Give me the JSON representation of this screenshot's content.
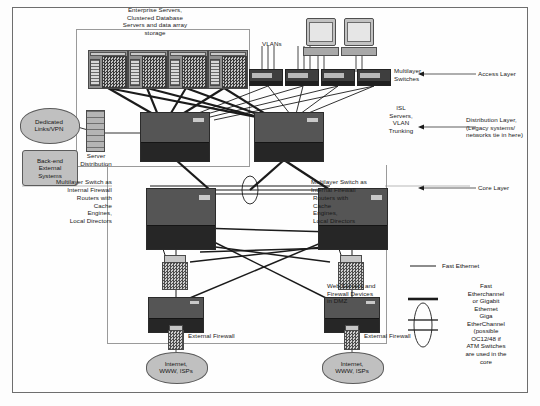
{
  "diagram": {
    "title_group_servers": "Enterprise Servers,\nClustered Database\nServers and data array\nstorage",
    "labels": {
      "vlans": "VLANs",
      "multilayer_switches": "Multilayer\nSwitches",
      "isl_servers": "ISL\nServers,\nVLAN\nTrunking",
      "server_distribution": "Server\nDistribution",
      "internal_firewall_left": "Multilayer Switch as\nInternal Firewall",
      "routers_left": "Routers with\nCache\nEngines,\nLocal Directors",
      "internal_firewall_right": "Multilayer Switch as\nInternal Firewall",
      "routers_right": "Routers with\nCache\nEngines,\nLocal Directors",
      "web_servers_dmz": "Web Servers and\nFirewall Devices\nin DMZ",
      "external_firewall_left": "External Firewall",
      "external_firewall_right": "External Firewall"
    },
    "layers": [
      {
        "name": "access",
        "text": "Access Layer"
      },
      {
        "name": "distribution",
        "text": "Distribution Layer,\n(Legacy systems/\nnetworks tie in here)"
      },
      {
        "name": "core",
        "text": "Core Layer"
      }
    ],
    "clouds": [
      {
        "name": "dedicated-links-vpn",
        "text": "Dedicated\nLinks/VPN"
      },
      {
        "name": "internet-left",
        "text": "Internet,\nWWW, ISPs"
      },
      {
        "name": "internet-right",
        "text": "Internet,\nWWW, ISPs"
      }
    ],
    "boxes": [
      {
        "name": "back-end-external-systems",
        "text": "Back-end\nExternal\nSystems"
      }
    ],
    "legend": {
      "items": [
        {
          "name": "fast-ethernet",
          "text": "Fast Ethernet",
          "style": "thin-line"
        },
        {
          "name": "fast-etherchannel-gigabit",
          "text": "Fast\nEtherchannel\nor Gigabit\nEthernet",
          "style": "thick-line"
        },
        {
          "name": "giga-etherchannel",
          "text": "Giga\nEtherChannel\n(possible\nOC12/48 if\nATM Switches\nare used in the\ncore",
          "style": "ellipse-bundle"
        }
      ]
    },
    "colors": {
      "frame_border": "#6e6e6e",
      "group_border": "#9a9a9a",
      "device_dark": "#4a4a4a",
      "device_mid": "#8f8f8f",
      "cloud_fill": "#c0c0c0",
      "line": "#1b1b1b",
      "text": "#161616",
      "background": "#fdfdfd"
    }
  }
}
